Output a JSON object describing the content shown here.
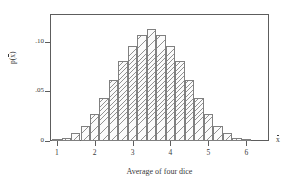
{
  "chart_data": {
    "type": "bar",
    "title": "",
    "subtitle": "",
    "xlabel": "Average of four dice",
    "ylabel": "p(x̄)",
    "axis_end_label": "x̄",
    "xlim": [
      0.82,
      6.6
    ],
    "ylim": [
      0,
      0.128
    ],
    "grid": false,
    "legend": null,
    "xticks": [
      1,
      2,
      3,
      4,
      5,
      6
    ],
    "xtick_labels": [
      "1",
      "2",
      "3",
      "4",
      "5",
      "6"
    ],
    "yticks": [
      0,
      0.05,
      0.1
    ],
    "ytick_labels": [
      "0",
      ".05",
      ".10"
    ],
    "bar_width": 0.25,
    "categories": [
      1,
      1.25,
      1.5,
      1.75,
      2,
      2.25,
      2.5,
      2.75,
      3,
      3.25,
      3.5,
      3.75,
      4,
      4.25,
      4.5,
      4.75,
      5,
      5.25,
      5.5,
      5.75,
      6
    ],
    "values": [
      0.0008,
      0.0031,
      0.0077,
      0.0154,
      0.027,
      0.0432,
      0.0617,
      0.0802,
      0.0956,
      0.1065,
      0.1126,
      0.1065,
      0.0956,
      0.0802,
      0.0617,
      0.0432,
      0.027,
      0.0154,
      0.0077,
      0.0031,
      0.0008
    ]
  }
}
